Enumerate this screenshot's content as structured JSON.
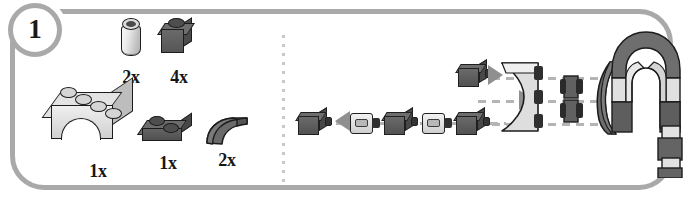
{
  "step": {
    "number": "1",
    "label": "Step 1"
  },
  "panel": {
    "border_color": "#a9a9a9",
    "background_color": "#ffffff",
    "divider": "vertical-dotted-divider"
  },
  "inventory": {
    "title": "Parts needed for this step",
    "rows": [
      {
        "parts": [
          {
            "id": "round-brick-1x1",
            "name": "Brick Round 1x1",
            "quantity": "2x",
            "color_name": "Light Gray",
            "color_hex": "#dcdcdc",
            "icon": "round-brick-icon"
          },
          {
            "id": "brick-1x1",
            "name": "Brick 1x1",
            "quantity": "4x",
            "color_name": "Dark Gray",
            "color_hex": "#6e6e6e",
            "icon": "brick-1x1-icon"
          }
        ]
      },
      {
        "parts": [
          {
            "id": "arch-1x4",
            "name": "Brick Arch 1x4",
            "quantity": "1x",
            "color_name": "Light Gray",
            "color_hex": "#e3e3e3",
            "icon": "arch-brick-icon"
          },
          {
            "id": "plate-1x2",
            "name": "Plate 1x2",
            "quantity": "1x",
            "color_name": "Dark Gray",
            "color_hex": "#6c6c6c",
            "icon": "plate-1x2-icon"
          },
          {
            "id": "slope-curved-1x2",
            "name": "Slope Curved 1x2",
            "quantity": "2x",
            "color_name": "Dark Gray",
            "color_hex": "#6a6a6a",
            "icon": "curved-slope-icon"
          }
        ]
      }
    ]
  },
  "assembly": {
    "title": "Assembly diagram",
    "description": "Exploded view: alternating dark 1x1 bricks and light round bricks connect into the arch brick, with curved slopes attached on the right; result is the finished arch-and-column element.",
    "chain": [
      {
        "id": "chain-brick-1",
        "type": "brick-1x1",
        "color_name": "Dark Gray"
      },
      {
        "id": "chain-arrow-1",
        "type": "assembly-arrow",
        "direction": "left"
      },
      {
        "id": "chain-round-1",
        "type": "round-brick-1x1",
        "color_name": "Light Gray"
      },
      {
        "id": "chain-brick-2",
        "type": "brick-1x1",
        "color_name": "Dark Gray"
      },
      {
        "id": "chain-round-2",
        "type": "round-brick-1x1",
        "color_name": "Light Gray"
      },
      {
        "id": "chain-brick-3",
        "type": "brick-1x1",
        "color_name": "Dark Gray"
      },
      {
        "id": "chain-arch",
        "type": "arch-1x4",
        "color_name": "Light Gray"
      },
      {
        "id": "chain-brick-top",
        "type": "brick-1x1",
        "color_name": "Dark Gray"
      },
      {
        "id": "chain-mini-stack",
        "type": "brick-1x1-stack",
        "color_name": "Dark Gray"
      },
      {
        "id": "chain-slopes",
        "type": "slope-curved-1x2-pair",
        "color_name": "Dark Gray"
      }
    ],
    "alignment_guides": 3,
    "result": {
      "id": "finished-assembly",
      "name": "Finished arch assembly",
      "description": "Arch with a downward column of alternating dark and light bricks"
    }
  }
}
